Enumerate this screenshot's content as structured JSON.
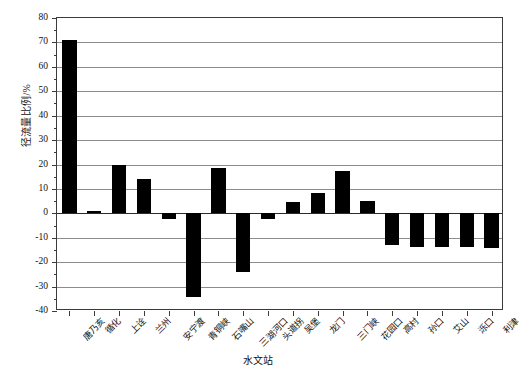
{
  "chart_data": {
    "type": "bar",
    "title": "",
    "subtitle": "",
    "xlabel": "水文站",
    "ylabel": "径流量比例/%",
    "ylim": [
      -40,
      80
    ],
    "ytick_step": 10,
    "grid": true,
    "legend": "none",
    "orientation": "vertical",
    "bar_color": "#000000",
    "categories": [
      "唐乃亥",
      "循化",
      "上诠",
      "兰州",
      "安宁渡",
      "青铜峡",
      "石嘴山",
      "三湖河口",
      "头道拐",
      "吴堡",
      "龙门",
      "三门峡",
      "花园口",
      "高村",
      "孙口",
      "艾山",
      "泺口",
      "利津"
    ],
    "values": [
      70.8,
      0.8,
      19.6,
      14.2,
      -2.2,
      -34.2,
      18.6,
      -24.0,
      -2.4,
      4.8,
      8.2,
      17.2,
      5.0,
      -13.0,
      -13.6,
      -13.6,
      -13.6,
      -14.2
    ],
    "yticks": [
      "80",
      "70",
      "60",
      "50",
      "40",
      "30",
      "20",
      "10",
      "0",
      "-10",
      "-20",
      "-30",
      "-40"
    ],
    "ytick_values": [
      80,
      70,
      60,
      50,
      40,
      30,
      20,
      10,
      0,
      -10,
      -20,
      -30,
      -40
    ]
  }
}
